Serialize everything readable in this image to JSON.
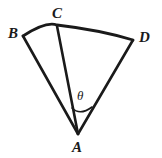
{
  "figure": {
    "name": "circular-sector-diagram",
    "background_color": "#ffffff",
    "stroke_color": "#1a1a1a",
    "labels": {
      "apex": "A",
      "arc_left": "B",
      "arc_middle": "C",
      "arc_right": "D",
      "angle": "θ"
    },
    "geometry": {
      "apex_point": [
        78,
        134
      ],
      "point_B": [
        23,
        36
      ],
      "point_C": [
        57,
        26
      ],
      "point_D": [
        133,
        40
      ],
      "arc_sweep_path": "M 23 36 Q 78 16 133 40",
      "angle_arc_radius": 27,
      "angle_arc_path": "M 64 111 Q 78 118 94 110"
    }
  }
}
